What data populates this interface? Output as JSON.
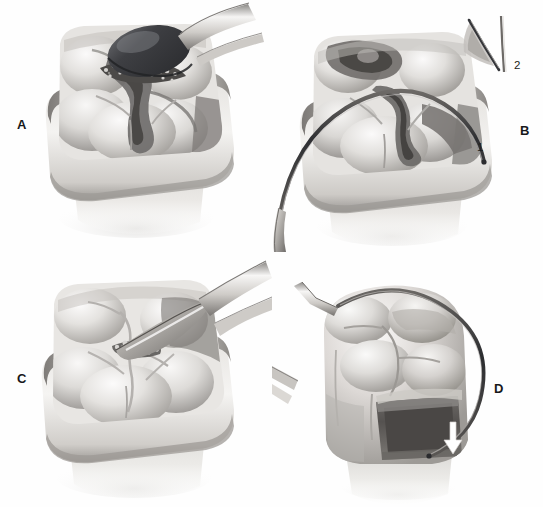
{
  "figure": {
    "medium": "grayscale airbrush and pencil medical illustration",
    "background_color": "#fefefe",
    "width": 543,
    "height": 507,
    "panel_count": 4
  },
  "panels": [
    {
      "id": "A",
      "label": "A",
      "label_x": 17,
      "label_y": 118,
      "caption_text": "A",
      "description": "Occlusal view of a molar encircled by a metal matrix band. An amalgam carrier tip dispenses granular amalgam into the prepared occlusal cavity.",
      "subject": "molar-tooth-with-matrix-band",
      "instrument": "amalgam-carrier",
      "instrument_tip_color": "#3b3c40",
      "material": "granular-amalgam",
      "view": "occlusal"
    },
    {
      "id": "B",
      "label": "B",
      "label_x": 520,
      "label_y": 124,
      "caption_text": "B",
      "description": "Occlusal view of the same molar in a matrix band with a curved explorer sweeping the occlusal surface. Callout 1 marks the matrix band margin; inset 2 shows a cross-section of the blade against the wedge.",
      "subject": "molar-tooth-with-matrix-band",
      "instrument": "curved-explorer-probe",
      "view": "occlusal",
      "has_inset": true
    },
    {
      "id": "C",
      "label": "C",
      "label_x": 17,
      "label_y": 372,
      "caption_text": "C",
      "description": "Occlusal view of the restored molar in a matrix band with a carver blade contacting residual amalgam at the central fissure.",
      "subject": "molar-tooth-with-matrix-band",
      "instrument": "carver-blade",
      "material": "granular-amalgam",
      "view": "occlusal"
    },
    {
      "id": "D",
      "label": "D",
      "label_x": 494,
      "label_y": 382,
      "caption_text": "D",
      "description": "Buccal-proximal view of the molar after matrix removal. A curved explorer traces the proximal margin; a white arrow indicates the gingival cavosurface margin of the dark proximal box.",
      "subject": "molar-tooth-proximal-view",
      "instrument": "curved-explorer-probe",
      "view": "buccal-proximal",
      "has_arrow": true,
      "arrow_color": "#ffffff",
      "arrow_direction": "down"
    }
  ],
  "callouts": [
    {
      "id": "1",
      "text": "1",
      "x": 477,
      "y": 142,
      "panel": "B",
      "refers_to": "matrix-band-margin"
    },
    {
      "id": "2",
      "text": "2",
      "x": 514,
      "y": 60,
      "panel": "B",
      "refers_to": "inset-cross-section-of-blade-and-wedge"
    }
  ],
  "inset": {
    "panel": "B",
    "label": "2",
    "x": 484,
    "y": 18,
    "width": 44,
    "height": 62,
    "description": "Cross-sectional detail: curved instrument blade passing beside a triangular wedge."
  },
  "palette": {
    "background": "#fefefe",
    "enamel_light": "#f2f1ef",
    "enamel_mid": "#d6d4d1",
    "enamel_shadow": "#a8a5a1",
    "deep_shadow": "#6b6967",
    "matrix_band_light": "#eceae7",
    "matrix_band_mid": "#c9c6c2",
    "matrix_band_dark": "#8d8a86",
    "instrument_metal_light": "#f4f3f1",
    "instrument_metal_mid": "#b9b6b2",
    "instrument_metal_dark": "#55565a",
    "amalgam_dark": "#3b3c40",
    "cavity_dark": "#4a4846",
    "label_text": "#17181a"
  }
}
